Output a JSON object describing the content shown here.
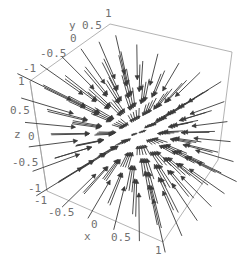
{
  "chart_data": {
    "type": "vector_field_3d",
    "title": "",
    "field": "F(x,y,z) = -(x, y, z)",
    "grid": {
      "x": [
        -1,
        -0.6,
        -0.2,
        0.2,
        0.6,
        1
      ],
      "y": [
        -1,
        -0.6,
        -0.2,
        0.2,
        0.6,
        1
      ],
      "z": [
        -1,
        -0.6,
        -0.2,
        0.2,
        0.6,
        1
      ]
    },
    "xlabel": "x",
    "ylabel": "y",
    "zlabel": "z",
    "xlim": [
      -1,
      1
    ],
    "ylim": [
      -1,
      1
    ],
    "zlim": [
      -1,
      1
    ],
    "x_ticks": [
      "-1",
      "-0.5",
      "0",
      "0.5",
      "1"
    ],
    "y_ticks": [
      "-1",
      "-0.5",
      "0",
      "0.5",
      "1"
    ],
    "z_ticks": [
      "-1",
      "-0.5",
      "0",
      "0.5",
      "1"
    ],
    "box": true,
    "grid_lines": false,
    "legend": false,
    "colors": {
      "arrow": "#3a3a3a",
      "box": "#a0a0a0",
      "labels": "#707070"
    }
  },
  "labels": {
    "x_axis": {
      "name": "x",
      "ticks": [
        {
          "text": "-1",
          "x": 34,
          "y": 204
        },
        {
          "text": "-0.5",
          "x": 48,
          "y": 216
        },
        {
          "text": "0",
          "x": 91,
          "y": 228
        },
        {
          "text": "0.5",
          "x": 111,
          "y": 241
        },
        {
          "text": "1",
          "x": 155,
          "y": 254
        }
      ],
      "name_pos": {
        "x": 84,
        "y": 240
      }
    },
    "y_axis": {
      "name": "y",
      "ticks": [
        {
          "text": "-1",
          "x": 23,
          "y": 72
        },
        {
          "text": "-0.5",
          "x": 40,
          "y": 57
        },
        {
          "text": "0",
          "x": 70,
          "y": 42
        },
        {
          "text": "0.5",
          "x": 82,
          "y": 29
        },
        {
          "text": "1",
          "x": 105,
          "y": 17
        }
      ],
      "name_pos": {
        "x": 69,
        "y": 29
      }
    },
    "z_axis": {
      "name": "z",
      "ticks": [
        {
          "text": "1",
          "x": 18,
          "y": 85
        },
        {
          "text": "0.5",
          "x": 10,
          "y": 114
        },
        {
          "text": "0",
          "x": 28,
          "y": 140
        },
        {
          "text": "-0.5",
          "x": 12,
          "y": 166
        },
        {
          "text": "-1",
          "x": 28,
          "y": 192
        }
      ],
      "name_pos": {
        "x": 14,
        "y": 138
      }
    }
  },
  "box_outline": [
    [
      30,
      81
    ],
    [
      110,
      24
    ],
    [
      232,
      52
    ],
    [
      218,
      160
    ],
    [
      163,
      242
    ],
    [
      47,
      191
    ],
    [
      30,
      81
    ]
  ],
  "box_inner": [
    [
      [
        47,
        191
      ],
      [
        30,
        81
      ]
    ]
  ],
  "projection": {
    "origin": [
      138,
      133
    ],
    "ex": [
      58,
      25.5
    ],
    "ey": [
      42,
      -27
    ],
    "ez": [
      -8.5,
      -55
    ],
    "persp": 0.1,
    "arrow_scale": 0.42
  }
}
